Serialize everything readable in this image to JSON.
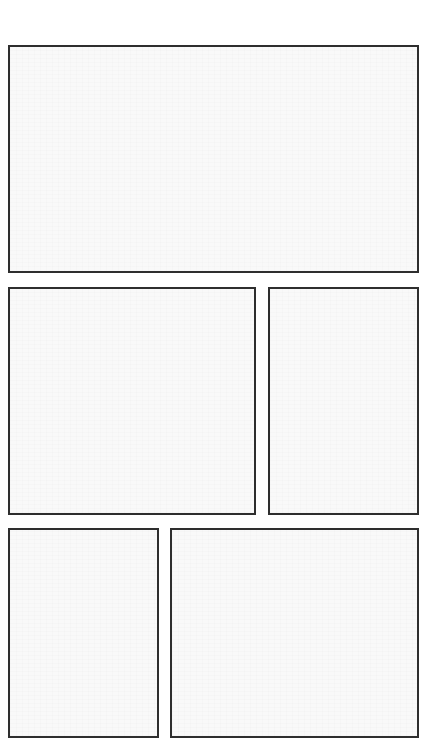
{
  "page": {
    "type": "comic-page-template",
    "panel_count": 5,
    "rows": [
      {
        "row": 1,
        "panels": [
          "panel-1"
        ]
      },
      {
        "row": 2,
        "panels": [
          "panel-2",
          "panel-3"
        ]
      },
      {
        "row": 3,
        "panels": [
          "panel-4",
          "panel-5"
        ]
      }
    ]
  },
  "panels": [
    {
      "id": "panel-1",
      "content": ""
    },
    {
      "id": "panel-2",
      "content": ""
    },
    {
      "id": "panel-3",
      "content": ""
    },
    {
      "id": "panel-4",
      "content": ""
    },
    {
      "id": "panel-5",
      "content": ""
    }
  ],
  "colors": {
    "border": "#2e2e2e",
    "panel_fill": "#f9f9f9",
    "page_background": "#ffffff"
  }
}
